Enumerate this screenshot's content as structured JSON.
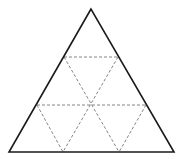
{
  "diagram": {
    "colors": {
      "background": "#ffffff",
      "outline": "#1a1a1a",
      "dashed": "#777777"
    },
    "outer_triangle": {
      "apex": [
        91,
        9
      ],
      "bottom_left": [
        9,
        152
      ],
      "bottom_right": [
        174,
        152
      ]
    },
    "dashed_lines": [
      {
        "name": "top-horizontal",
        "x1": 64,
        "y1": 57,
        "x2": 118,
        "y2": 57
      },
      {
        "name": "middle-horizontal",
        "x1": 37,
        "y1": 105,
        "x2": 146,
        "y2": 105
      },
      {
        "name": "top-left-to-bottom-right-1",
        "x1": 64,
        "y1": 57,
        "x2": 119,
        "y2": 152
      },
      {
        "name": "top-right-to-bottom-left-1",
        "x1": 118,
        "y1": 57,
        "x2": 63,
        "y2": 152
      },
      {
        "name": "mid-left-to-bottom",
        "x1": 37,
        "y1": 105,
        "x2": 63,
        "y2": 152
      },
      {
        "name": "mid-right-to-bottom",
        "x1": 146,
        "y1": 105,
        "x2": 119,
        "y2": 152
      }
    ],
    "center": [
      91,
      105
    ]
  }
}
